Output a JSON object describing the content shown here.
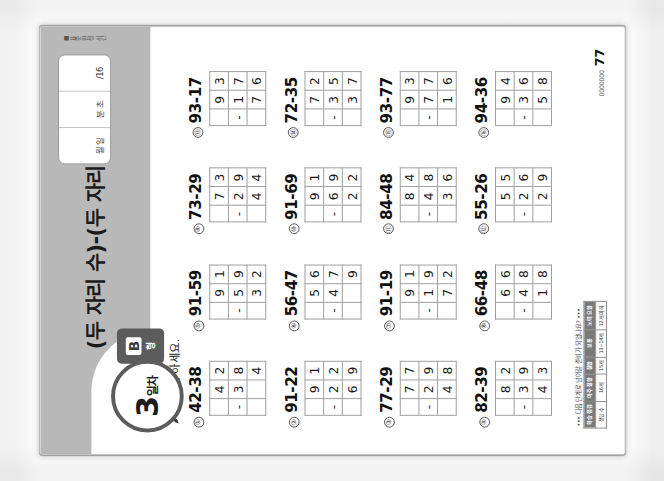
{
  "page": {
    "title": "(두 자리 수)-(두 자리 수)",
    "day_number": "3",
    "day_unit": "일차",
    "type_letter": "B",
    "type_kor": "형",
    "instruction": "뺄셈을 하세요.",
    "pencil_icon": "pencil-icon",
    "page_number": "77",
    "brand": "0000000"
  },
  "meta_box": {
    "cells": [
      {
        "label": "월  일"
      },
      {
        "label": "분  초"
      },
      {
        "label": "/16"
      }
    ],
    "note": "■ 표준 완성 시간"
  },
  "footer": {
    "note": "••• 다음 단계로 넘어갈 준비가 되었나요? •••",
    "check_table": {
      "headers": [
        "학습 점검",
        "아주 잘함",
        "잘함",
        "보통",
        "노력 요함"
      ],
      "row": [
        "정답 수",
        "16개",
        "15개",
        "13~14개",
        "12개 이하"
      ]
    }
  },
  "problems": [
    {
      "id": "①",
      "expr": "42-38",
      "minuend": "42",
      "subtrahend": "38",
      "answer": "4",
      "op": "-"
    },
    {
      "id": "⑤",
      "expr": "91-59",
      "minuend": "91",
      "subtrahend": "59",
      "answer": "32",
      "op": "-"
    },
    {
      "id": "⑨",
      "expr": "73-29",
      "minuend": "73",
      "subtrahend": "29",
      "answer": "44",
      "op": "-"
    },
    {
      "id": "⑬",
      "expr": "93-17",
      "minuend": "93",
      "subtrahend": "17",
      "answer": "76",
      "op": "-"
    },
    {
      "id": "②",
      "expr": "91-22",
      "minuend": "91",
      "subtrahend": "22",
      "answer": "69",
      "op": "-"
    },
    {
      "id": "⑥",
      "expr": "56-47",
      "minuend": "56",
      "subtrahend": "47",
      "answer": "9",
      "op": "-"
    },
    {
      "id": "⑩",
      "expr": "91-69",
      "minuend": "91",
      "subtrahend": "69",
      "answer": "22",
      "op": "-"
    },
    {
      "id": "⑭",
      "expr": "72-35",
      "minuend": "72",
      "subtrahend": "35",
      "answer": "37",
      "op": "-"
    },
    {
      "id": "③",
      "expr": "77-29",
      "minuend": "77",
      "subtrahend": "29",
      "answer": "48",
      "op": "-"
    },
    {
      "id": "⑦",
      "expr": "91-19",
      "minuend": "91",
      "subtrahend": "19",
      "answer": "72",
      "op": "-"
    },
    {
      "id": "⑪",
      "expr": "84-48",
      "minuend": "84",
      "subtrahend": "48",
      "answer": "36",
      "op": "-"
    },
    {
      "id": "⑮",
      "expr": "93-77",
      "minuend": "93",
      "subtrahend": "77",
      "answer": "16",
      "op": "-"
    },
    {
      "id": "④",
      "expr": "82-39",
      "minuend": "82",
      "subtrahend": "39",
      "answer": "43",
      "op": "-"
    },
    {
      "id": "⑧",
      "expr": "66-48",
      "minuend": "66",
      "subtrahend": "48",
      "answer": "18",
      "op": "-"
    },
    {
      "id": "⑫",
      "expr": "55-26",
      "minuend": "55",
      "subtrahend": "26",
      "answer": "29",
      "op": "-"
    },
    {
      "id": "⑯",
      "expr": "94-36",
      "minuend": "94",
      "subtrahend": "36",
      "answer": "58",
      "op": "-"
    }
  ]
}
